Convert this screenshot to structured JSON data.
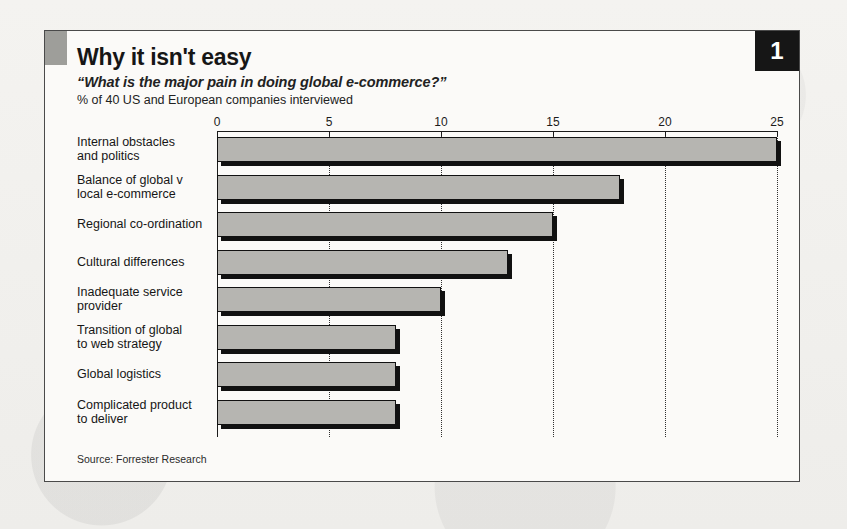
{
  "card": {
    "badge": "1",
    "title": "Why it isn't easy",
    "subtitle": "“What is the major pain in doing global e-commerce?”",
    "unit_line": "% of 40 US and European companies interviewed",
    "source": "Source: Forrester Research"
  },
  "colors": {
    "bar_fill": "#b6b5b1",
    "bar_outline": "#111111",
    "badge_bg": "#161616",
    "badge_text": "#ffffff",
    "accent_square": "#9e9e9a",
    "card_bg": "#fbfaf8",
    "page_bg": "#f2f1ee"
  },
  "chart_data": {
    "type": "bar",
    "orientation": "horizontal",
    "title": "Why it isn't easy",
    "subtitle": "“What is the major pain in doing global e-commerce?”",
    "xlabel": "% of 40 US and European companies interviewed",
    "ylabel": "",
    "xlim": [
      0,
      25
    ],
    "xticks": [
      0,
      5,
      10,
      15,
      20,
      25
    ],
    "xtick_labels": [
      "0",
      "5",
      "10",
      "15",
      "20",
      "25"
    ],
    "axis_position": "top",
    "grid": "vertical-dotted",
    "legend": "none",
    "categories": [
      "Internal obstacles\nand politics",
      "Balance of global v\nlocal e-commerce",
      "Regional co-ordination",
      "Cultural differences",
      "Inadequate service\nprovider",
      "Transition of global\nto web strategy",
      "Global logistics",
      "Complicated product\nto deliver"
    ],
    "values": [
      25,
      18,
      15,
      13,
      10,
      8,
      8,
      8
    ],
    "source": "Source: Forrester Research"
  }
}
